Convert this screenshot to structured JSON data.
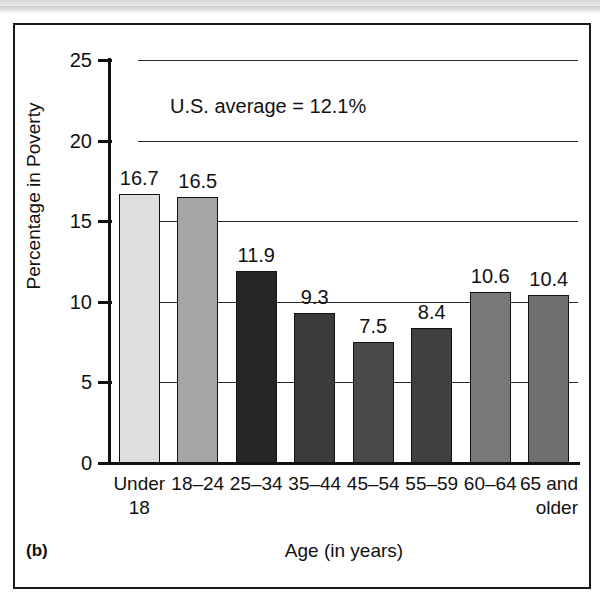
{
  "figure": {
    "panel_label": "(b)",
    "annotation": "U.S. average = 12.1%"
  },
  "chart_data": {
    "type": "bar",
    "title": "",
    "xlabel": "Age (in years)",
    "ylabel": "Percentage in Poverty",
    "ylim": [
      0,
      25
    ],
    "ytick_labels": [
      "0",
      "5",
      "10",
      "15",
      "20",
      "25"
    ],
    "ytick_values": [
      0,
      5,
      10,
      15,
      20,
      25
    ],
    "grid": "horizontal",
    "legend": "none",
    "annotations": [
      "U.S. average = 12.1%"
    ],
    "categories": [
      "Under 18",
      "18–24",
      "25–34",
      "35–44",
      "45–54",
      "55–59",
      "60–64",
      "65 and older"
    ],
    "category_lines": [
      [
        "Under",
        "18"
      ],
      [
        "18–24",
        ""
      ],
      [
        "25–34",
        ""
      ],
      [
        "35–44",
        ""
      ],
      [
        "45–54",
        ""
      ],
      [
        "55–59",
        ""
      ],
      [
        "60–64",
        ""
      ],
      [
        "65 and",
        "older"
      ]
    ],
    "values": [
      16.7,
      16.5,
      11.9,
      9.3,
      7.5,
      8.4,
      10.6,
      10.4
    ],
    "value_labels": [
      "16.7",
      "16.5",
      "11.9",
      "9.3",
      "7.5",
      "8.4",
      "10.6",
      "10.4"
    ],
    "bar_colors": [
      "#dedede",
      "#a5a5a5",
      "#262626",
      "#3b3b3b",
      "#4a4a4a",
      "#3f3f3f",
      "#787878",
      "#6f6f6f"
    ],
    "bar_edge_color": "#111111",
    "axis_color": "#111111",
    "grid_color": "#2b2b2b",
    "background": "#ffffff"
  }
}
